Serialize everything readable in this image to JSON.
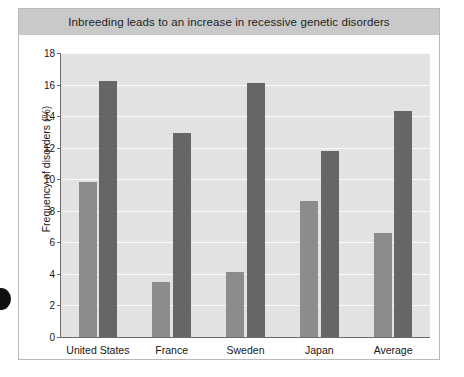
{
  "figure": {
    "title": "Inbreeding leads to an increase in recessive genetic disorders",
    "title_band_color": "#c9c9c9",
    "plot_background": "#e2e2e2",
    "frame_color": "#b9b9b9"
  },
  "chart_data": {
    "type": "bar",
    "title": "Inbreeding leads to an increase in recessive genetic disorders",
    "xlabel": "",
    "ylabel": "Frequency of disorders (%)",
    "ylim": [
      0,
      18
    ],
    "ytick_step": 2,
    "yticks": [
      "0",
      "2",
      "4",
      "6",
      "8",
      "10",
      "12",
      "14",
      "16",
      "18"
    ],
    "grid": true,
    "legend": "none",
    "categories": [
      "United States",
      "France",
      "Sweden",
      "Japan",
      "Average"
    ],
    "series": [
      {
        "name": "Non-consanguineous",
        "color": "#8c8c8c",
        "values": [
          9.8,
          3.5,
          4.1,
          8.6,
          6.6
        ]
      },
      {
        "name": "Consanguineous",
        "color": "#666666",
        "values": [
          16.2,
          12.9,
          16.1,
          11.8,
          14.3
        ]
      }
    ]
  },
  "artifacts": {
    "hole_punch": "hole-punch-mark"
  }
}
